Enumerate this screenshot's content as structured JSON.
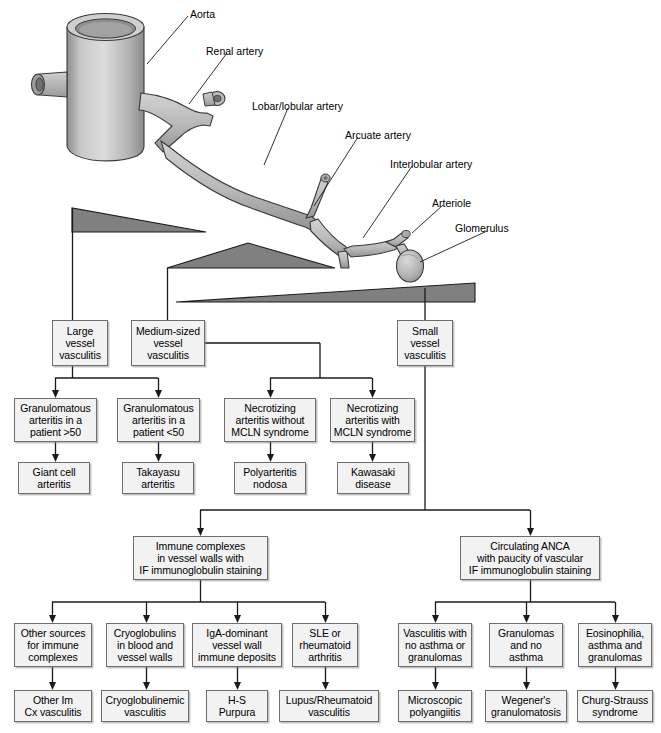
{
  "figure": {
    "anatomy_labels": [
      {
        "name": "aorta",
        "text": "Aorta",
        "x": 190,
        "y": 8
      },
      {
        "name": "renal-artery",
        "text": "Renal artery",
        "x": 206,
        "y": 45
      },
      {
        "name": "lobar-lobular-artery",
        "text": "Lobar/lobular artery",
        "x": 252,
        "y": 100
      },
      {
        "name": "arcuate-artery",
        "text": "Arcuate artery",
        "x": 345,
        "y": 129
      },
      {
        "name": "interlobular-artery",
        "text": "Interlobular artery",
        "x": 390,
        "y": 158
      },
      {
        "name": "arteriole",
        "text": "Arteriole",
        "x": 432,
        "y": 197
      },
      {
        "name": "glomerulus",
        "text": "Glomerulus",
        "x": 455,
        "y": 222
      }
    ],
    "size_wedges": [
      {
        "name": "large-vessel-wedge",
        "label": "large vessel size range"
      },
      {
        "name": "medium-vessel-wedge",
        "label": "medium vessel size range"
      },
      {
        "name": "small-vessel-wedge",
        "label": "small vessel size range"
      }
    ],
    "colors": {
      "wedge_fill": "#808080",
      "wedge_stroke": "#1a1a1a",
      "vessel_fill": "#b5b5b5",
      "vessel_stroke": "#3a3a3a",
      "box_fill": "#f2f2f2",
      "box_stroke": "#6e6e6e",
      "connector": "#1a1a1a"
    }
  },
  "nodes": {
    "large_vessel": {
      "text": "Large\nvessel\nvasculitis",
      "x": 52,
      "y": 320,
      "w": 56,
      "h": 46
    },
    "medium_vessel": {
      "text": "Medium-sized\nvessel\nvasculitis",
      "x": 131,
      "y": 320,
      "w": 74,
      "h": 46
    },
    "small_vessel": {
      "text": "Small\nvessel\nvasculitis",
      "x": 397,
      "y": 320,
      "w": 56,
      "h": 46
    },
    "granulomatous_over50": {
      "text": "Granulomatous\narteritis in a\npatient >50",
      "x": 14,
      "y": 398,
      "w": 83,
      "h": 44
    },
    "granulomatous_under50": {
      "text": "Granulomatous\narteritis in a\npatient <50",
      "x": 117,
      "y": 398,
      "w": 83,
      "h": 44
    },
    "necrotizing_without_mcln": {
      "text": "Necrotizing\narteritis without\nMCLN syndrome",
      "x": 224,
      "y": 398,
      "w": 92,
      "h": 44
    },
    "necrotizing_with_mcln": {
      "text": "Necrotizing\narteritis with\nMCLN syndrome",
      "x": 330,
      "y": 398,
      "w": 85,
      "h": 44
    },
    "giant_cell": {
      "text": "Giant cell\narteritis",
      "x": 18,
      "y": 462,
      "w": 72,
      "h": 32
    },
    "takayasu": {
      "text": "Takayasu\narteritis",
      "x": 122,
      "y": 462,
      "w": 72,
      "h": 32
    },
    "polyarteritis": {
      "text": "Polyarteritis\nnodosa",
      "x": 234,
      "y": 462,
      "w": 72,
      "h": 32
    },
    "kawasaki": {
      "text": "Kawasaki\ndisease",
      "x": 337,
      "y": 462,
      "w": 72,
      "h": 32
    },
    "immune_complexes": {
      "text": "Immune complexes\nin vessel walls with\nIF immunoglobulin staining",
      "x": 133,
      "y": 536,
      "w": 135,
      "h": 44
    },
    "circulating_anca": {
      "text": "Circulating ANCA\nwith paucity of vascular\nIF immunoglobulin staining",
      "x": 460,
      "y": 536,
      "w": 140,
      "h": 44
    },
    "other_sources": {
      "text": "Other sources\nfor immune\ncomplexes",
      "x": 14,
      "y": 623,
      "w": 78,
      "h": 44
    },
    "cryoglobulins": {
      "text": "Cryoglobulins\nin blood and\nvessel walls",
      "x": 106,
      "y": 623,
      "w": 78,
      "h": 44
    },
    "iga_dominant": {
      "text": "IgA-dominant\nvessel wall\nimmune deposits",
      "x": 192,
      "y": 623,
      "w": 90,
      "h": 44
    },
    "sle_ra": {
      "text": "SLE or\nrheumatoid\narthritis",
      "x": 292,
      "y": 623,
      "w": 66,
      "h": 44
    },
    "vasculitis_no_asthma": {
      "text": "Vasculitis with\nno asthma or\ngranulomas",
      "x": 398,
      "y": 623,
      "w": 74,
      "h": 44
    },
    "granulomas_no_asthma": {
      "text": "Granulomas\nand no\nasthma",
      "x": 489,
      "y": 623,
      "w": 74,
      "h": 44
    },
    "eosinophilia_asthma": {
      "text": "Eosinophilia,\nasthma and\ngranulomas",
      "x": 578,
      "y": 623,
      "w": 74,
      "h": 44
    },
    "other_im_cx": {
      "text": "Other Im\nCx vasculitis",
      "x": 14,
      "y": 690,
      "w": 78,
      "h": 32
    },
    "cryoglobulinemic": {
      "text": "Cryoglobulinemic\nvasculitis",
      "x": 101,
      "y": 690,
      "w": 88,
      "h": 32
    },
    "hs_purpura": {
      "text": "H-S\nPurpura",
      "x": 206,
      "y": 690,
      "w": 62,
      "h": 32
    },
    "lupus_rheumatoid": {
      "text": "Lupus/Rheumatoid\nvasculitis",
      "x": 279,
      "y": 690,
      "w": 100,
      "h": 32
    },
    "microscopic_polyangiitis": {
      "text": "Microscopic\npolyangiitis",
      "x": 398,
      "y": 690,
      "w": 74,
      "h": 32
    },
    "wegeners": {
      "text": "Wegener's\ngranulomatosis",
      "x": 485,
      "y": 690,
      "w": 82,
      "h": 32
    },
    "churg_strauss": {
      "text": "Churg-Strauss\nsyndrome",
      "x": 577,
      "y": 690,
      "w": 76,
      "h": 32
    }
  }
}
